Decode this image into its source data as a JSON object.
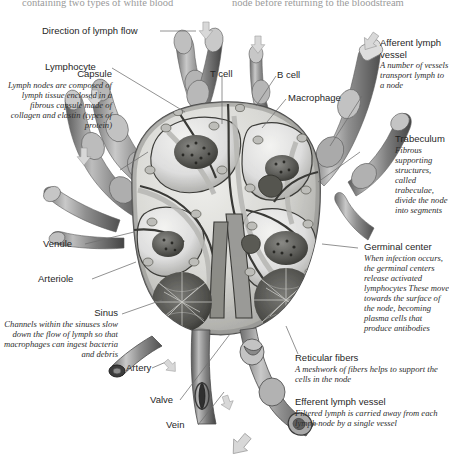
{
  "page": {
    "header_left_fragment": "containing two types of white blood",
    "header_right_fragment": "node before returning to the bloodstream",
    "flow_label": "Direction of lymph flow"
  },
  "colors": {
    "background": "#ffffff",
    "text": "#262626",
    "italic_text": "#2d2d2d",
    "leader_line": "#6d6d6d",
    "arrow_fill": "#d8d8d8",
    "arrow_stroke": "#9a9a9a",
    "vessel_dark": "#4a4a4a",
    "vessel_mid": "#8d8d8d",
    "vessel_light": "#cfcfcf",
    "node_fill": "#d9d9d6",
    "node_pale": "#ececea"
  },
  "labels": {
    "lymphocyte": {
      "title": "Lymphocyte"
    },
    "t_cell": {
      "title": "T cell"
    },
    "b_cell": {
      "title": "B cell"
    },
    "macrophage": {
      "title": "Macrophage"
    },
    "venule": {
      "title": "Venule"
    },
    "arteriole": {
      "title": "Arteriole"
    },
    "artery": {
      "title": "Artery"
    },
    "valve": {
      "title": "Valve"
    },
    "vein": {
      "title": "Vein"
    },
    "capsule": {
      "title": "Capsule",
      "desc": "Lymph nodes are composed of lymph tissue enclosed in a fibrous capsule made of collagen and elastin (types of protein)"
    },
    "sinus": {
      "title": "Sinus",
      "desc": "Channels within the sinuses slow down the flow of lymph so that macrophages can ingest bacteria and debris"
    },
    "afferent": {
      "title": "Afferent lymph vessel",
      "desc": "A number of vessels transport lymph to a node"
    },
    "trabeculum": {
      "title": "Trabeculum",
      "desc": "Fibrous supporting structures, called trabeculae, divide the node into segments"
    },
    "germinal": {
      "title": "Germinal center",
      "desc": "When infection occurs, the germinal centers release activated lymphocytes These move towards the surface of the node, becoming plasma cells that produce antibodies"
    },
    "reticular": {
      "title": "Reticular fibers",
      "desc": "A meshwork of fibers helps to support the cells in the node"
    },
    "efferent": {
      "title": "Efferent lymph vessel",
      "desc": "Filtered lymph is carried away from each lymph node by a single vessel"
    }
  }
}
